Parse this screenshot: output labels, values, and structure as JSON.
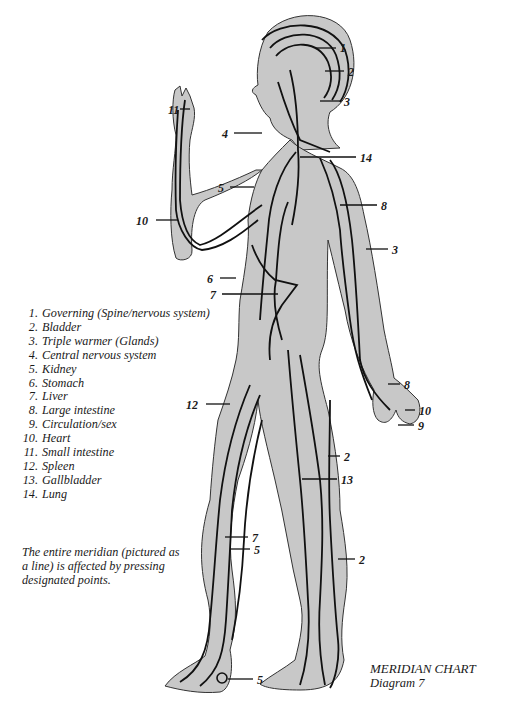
{
  "caption": {
    "title": "MERIDIAN CHART",
    "subtitle": "Diagram 7"
  },
  "legend": {
    "items": [
      {
        "num": "1.",
        "text": "Governing (Spine/nervous system)"
      },
      {
        "num": "2.",
        "text": "Bladder"
      },
      {
        "num": "3.",
        "text": "Triple warmer (Glands)"
      },
      {
        "num": "4.",
        "text": "Central nervous system"
      },
      {
        "num": "5.",
        "text": "Kidney"
      },
      {
        "num": "6.",
        "text": "Stomach"
      },
      {
        "num": "7.",
        "text": "Liver"
      },
      {
        "num": "8.",
        "text": "Large intestine"
      },
      {
        "num": "9.",
        "text": "Circulation/sex"
      },
      {
        "num": "10.",
        "text": "Heart"
      },
      {
        "num": "11.",
        "text": "Small intestine"
      },
      {
        "num": "12.",
        "text": "Spleen"
      },
      {
        "num": "13.",
        "text": "Gallbladder"
      },
      {
        "num": "14.",
        "text": "Lung"
      }
    ]
  },
  "note": "The entire meridian (pictured as a line) is affected by pressing designated points.",
  "callouts": [
    {
      "label": "1",
      "x": 340,
      "y": 42
    },
    {
      "label": "2",
      "x": 348,
      "y": 66
    },
    {
      "label": "3",
      "x": 344,
      "y": 96
    },
    {
      "label": "11",
      "x": 168,
      "y": 104
    },
    {
      "label": "4",
      "x": 222,
      "y": 128
    },
    {
      "label": "14",
      "x": 360,
      "y": 152
    },
    {
      "label": "5",
      "x": 218,
      "y": 182
    },
    {
      "label": "8",
      "x": 381,
      "y": 200
    },
    {
      "label": "10",
      "x": 136,
      "y": 215
    },
    {
      "label": "3",
      "x": 392,
      "y": 244
    },
    {
      "label": "6",
      "x": 207,
      "y": 273
    },
    {
      "label": "7",
      "x": 210,
      "y": 289
    },
    {
      "label": "8",
      "x": 404,
      "y": 379
    },
    {
      "label": "12",
      "x": 186,
      "y": 399
    },
    {
      "label": "10",
      "x": 419,
      "y": 405
    },
    {
      "label": "9",
      "x": 418,
      "y": 420
    },
    {
      "label": "2",
      "x": 344,
      "y": 451
    },
    {
      "label": "13",
      "x": 341,
      "y": 474
    },
    {
      "label": "7",
      "x": 252,
      "y": 532
    },
    {
      "label": "5",
      "x": 254,
      "y": 544
    },
    {
      "label": "2",
      "x": 359,
      "y": 554
    },
    {
      "label": "5",
      "x": 257,
      "y": 674
    }
  ],
  "colors": {
    "body_fill": "#c8c8c8",
    "outline": "#2a2a2a",
    "meridian": "#111111"
  }
}
